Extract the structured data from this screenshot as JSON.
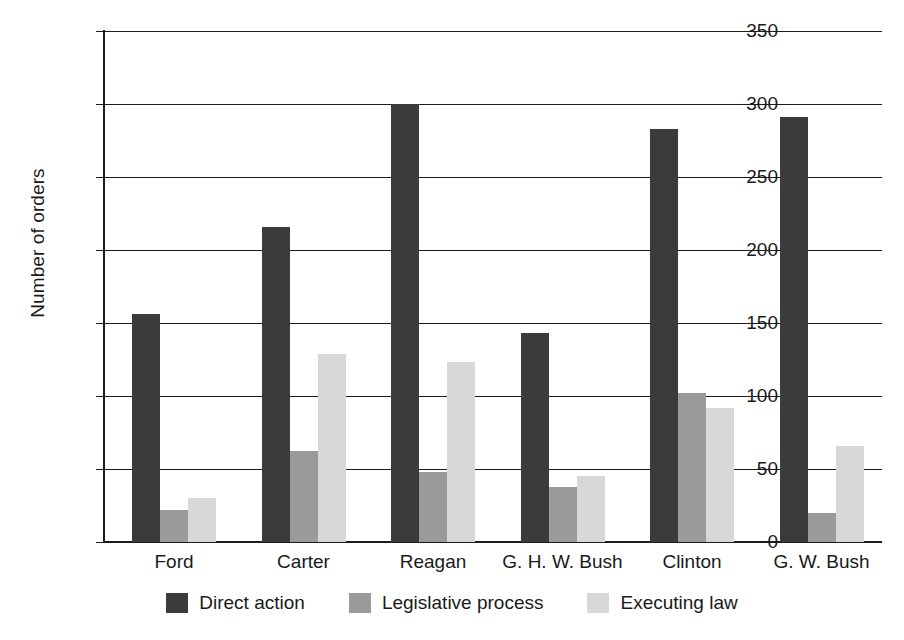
{
  "chart_data": {
    "type": "bar",
    "title": "",
    "xlabel": "",
    "ylabel": "Number of orders",
    "ylim": [
      0,
      350
    ],
    "yticks": [
      0,
      50,
      100,
      150,
      200,
      250,
      300,
      350
    ],
    "grid": true,
    "legend_position": "bottom",
    "categories": [
      "Ford",
      "Carter",
      "Reagan",
      "G. H. W. Bush",
      "Clinton",
      "G. W. Bush"
    ],
    "series": [
      {
        "name": "Direct action",
        "color": "#3b3b3b",
        "values": [
          156,
          216,
          300,
          143,
          283,
          291
        ]
      },
      {
        "name": "Legislative process",
        "color": "#9a9a9a",
        "values": [
          22,
          62,
          48,
          38,
          102,
          20
        ]
      },
      {
        "name": "Executing law",
        "color": "#d8d8d8",
        "values": [
          30,
          129,
          123,
          45,
          92,
          66
        ]
      }
    ]
  }
}
